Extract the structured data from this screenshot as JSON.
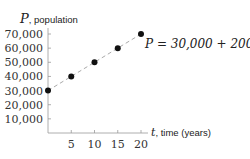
{
  "chart_data": {
    "type": "scatter",
    "title": "",
    "xlabel": "t, time (years)",
    "ylabel": "P, population",
    "xlabel_var": "t",
    "xlabel_text": ", time (years)",
    "ylabel_var": "P",
    "ylabel_text": ", population",
    "x": [
      0,
      5,
      10,
      15,
      20
    ],
    "series": [
      {
        "name": "P = 30,000 + 2000t",
        "values": [
          30000,
          40000,
          50000,
          60000,
          70000
        ]
      }
    ],
    "x_ticks": [
      "5",
      "10",
      "15",
      "20"
    ],
    "y_ticks": [
      "10,000",
      "20,000",
      "30,000",
      "40,000",
      "50,000",
      "60,000",
      "70,000"
    ],
    "xlim": [
      0,
      20
    ],
    "ylim": [
      0,
      70000
    ],
    "grid": false,
    "annotations": [
      "P = 30,000 + 2000t"
    ],
    "line_style": "dashed",
    "point_color": "#111111",
    "line_color": "#aaaaaa"
  }
}
